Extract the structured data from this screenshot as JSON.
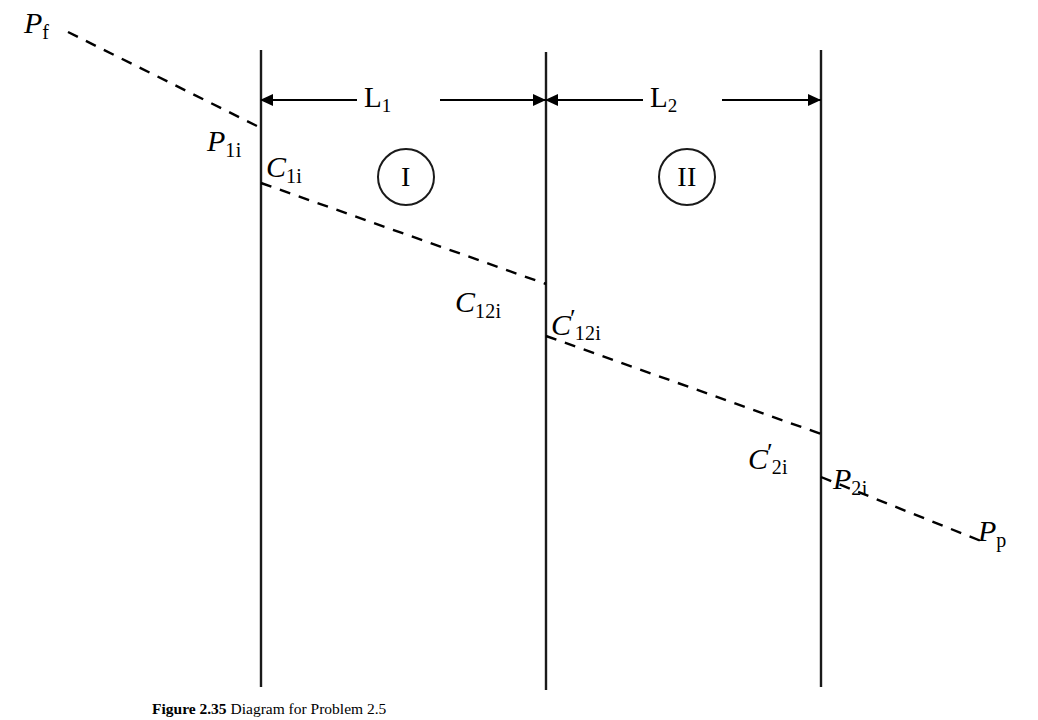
{
  "figure": {
    "caption_label": "Figure 2.35",
    "caption_text": "Diagram for Problem 2.5"
  },
  "diagram": {
    "type": "pressure-profile-schematic",
    "regions": [
      {
        "id": "region-1",
        "label": "I",
        "length_label": "L",
        "length_sub": "1"
      },
      {
        "id": "region-2",
        "label": "II",
        "length_label": "L",
        "length_sub": "2"
      }
    ],
    "dimensions": [
      {
        "name": "L1",
        "symbol": "L",
        "subscript": "1",
        "from_x": 261,
        "to_x": 546,
        "y": 100
      },
      {
        "name": "L2",
        "symbol": "L",
        "subscript": "2",
        "from_x": 546,
        "to_x": 821,
        "y": 100
      }
    ],
    "boundaries": [
      {
        "name": "boundary-1",
        "x": 261,
        "y_top": 50,
        "y_bottom": 687
      },
      {
        "name": "boundary-2",
        "x": 546,
        "y_top": 52,
        "y_bottom": 690
      },
      {
        "name": "boundary-3",
        "x": 821,
        "y_top": 50,
        "y_bottom": 687
      }
    ],
    "points": [
      {
        "name": "Pf",
        "symbol": "P",
        "subscript": "f",
        "prime": false,
        "x": 24,
        "y": 8,
        "anchor": "left"
      },
      {
        "name": "P1i",
        "symbol": "P",
        "subscript": "1i",
        "prime": false,
        "x": 207,
        "y": 126,
        "anchor": "left"
      },
      {
        "name": "C1i",
        "symbol": "C",
        "subscript": "1i",
        "prime": false,
        "x": 266,
        "y": 152,
        "anchor": "left"
      },
      {
        "name": "C12i",
        "symbol": "C",
        "subscript": "12i",
        "prime": false,
        "x": 455,
        "y": 287,
        "anchor": "left"
      },
      {
        "name": "C12i'",
        "symbol": "C",
        "subscript": "12i",
        "prime": true,
        "x": 551,
        "y": 306,
        "anchor": "left"
      },
      {
        "name": "C2i'",
        "symbol": "C",
        "subscript": "2i",
        "prime": true,
        "x": 748,
        "y": 440,
        "anchor": "left"
      },
      {
        "name": "P2i",
        "symbol": "P",
        "subscript": "2i",
        "prime": false,
        "x": 833,
        "y": 464,
        "anchor": "left"
      },
      {
        "name": "Pp",
        "symbol": "P",
        "subscript": "p",
        "prime": false,
        "x": 978,
        "y": 516,
        "anchor": "left"
      }
    ],
    "pressure_line_segments": [
      {
        "name": "segment-inlet",
        "x1": 68,
        "y1": 32,
        "x2": 261,
        "y2": 128
      },
      {
        "name": "segment-region1",
        "x1": 261,
        "y1": 183,
        "x2": 546,
        "y2": 284
      },
      {
        "name": "segment-region2",
        "x1": 546,
        "y1": 336,
        "x2": 821,
        "y2": 434
      },
      {
        "name": "segment-outlet",
        "x1": 821,
        "y1": 477,
        "x2": 986,
        "y2": 543
      }
    ],
    "colors": {
      "line": "#000000",
      "boundary": "#1a1a1a",
      "background": "#ffffff"
    }
  }
}
